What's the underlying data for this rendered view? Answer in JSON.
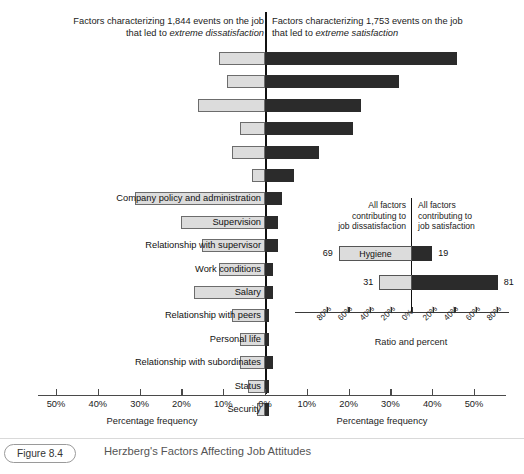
{
  "header": {
    "left_line1": "Factors characterizing 1,844 events on the job",
    "left_line2_prefix": "that led to ",
    "left_line2_em": "extreme dissatisfaction",
    "right_line1": "Factors characterizing 1,753 events on the job",
    "right_line2_prefix": "that led to ",
    "right_line2_em": "extreme satisfaction"
  },
  "axis": {
    "left_title": "Percentage frequency",
    "right_title": "Percentage frequency",
    "ticks_left": [
      "50%",
      "40%",
      "30%",
      "20%",
      "10%",
      "0%"
    ],
    "ticks_right": [
      "0%",
      "10%",
      "20%",
      "30%",
      "40%",
      "50%"
    ]
  },
  "inset": {
    "header_left": "All factors contributing to job dissatisfaction",
    "header_left_lines": [
      "All factors",
      "contributing to",
      "job dissatisfaction"
    ],
    "header_right": "All factors contributing to job satisfaction",
    "header_right_lines": [
      "All factors",
      "contributing to",
      "job satisfaction"
    ],
    "axis_title": "Ratio and percent",
    "ticks": [
      "80%",
      "60%",
      "40%",
      "20%",
      "0%",
      "20%",
      "40%",
      "60%",
      "80%"
    ],
    "rows": [
      {
        "label": "Hygiene",
        "left": 69,
        "right": 19,
        "left_value": "69",
        "right_value": "19"
      },
      {
        "label": "",
        "left": 31,
        "right": 81,
        "left_value": "31",
        "right_value": "81"
      }
    ]
  },
  "caption": {
    "figure_number": "Figure 8.4",
    "title": "Herzberg's Factors Affecting Job Attitudes"
  },
  "colors": {
    "dissatisfaction_bar": "#dcdcdc",
    "satisfaction_bar": "#2b2b2b",
    "axis": "#4a4a4a",
    "center_line": "#111111"
  },
  "chart_data": {
    "type": "bar",
    "title": "Herzberg's Factors Affecting Job Attitudes",
    "subtype": "diverging-horizontal",
    "xlabel": "Percentage frequency",
    "ylabel": "",
    "xlim": [
      -50,
      50
    ],
    "grid": false,
    "legend": [
      "Factors characterizing 1,844 events on the job that led to extreme dissatisfaction",
      "Factors characterizing 1,753 events on the job that led to extreme satisfaction"
    ],
    "categories": [
      "Achievement",
      "Recognition",
      "Work itself",
      "Responsibility",
      "Advancement",
      "Growth",
      "Company policy and administration",
      "Supervision",
      "Relationship with supervisor",
      "Work conditions",
      "Salary",
      "Relationship with peers",
      "Personal life",
      "Relationship with subordinates",
      "Status",
      "Security"
    ],
    "labeled_categories": [
      "Company policy and administration",
      "Supervision",
      "Relationship with supervisor",
      "Work conditions",
      "Salary",
      "Relationship with peers",
      "Personal life",
      "Relationship with subordinates",
      "Status",
      "Security"
    ],
    "series": [
      {
        "name": "Extreme dissatisfaction",
        "values": [
          11,
          9,
          16,
          6,
          8,
          3,
          31,
          20,
          15,
          11,
          17,
          8,
          6,
          6,
          4,
          2
        ]
      },
      {
        "name": "Extreme satisfaction",
        "values": [
          46,
          32,
          23,
          21,
          13,
          7,
          4,
          3,
          3,
          2,
          2,
          1,
          1,
          0,
          1,
          1
        ]
      }
    ],
    "rows": [
      {
        "label": "",
        "left": 11,
        "right": 46,
        "labeled": false
      },
      {
        "label": "",
        "left": 9,
        "right": 32,
        "labeled": false
      },
      {
        "label": "",
        "left": 16,
        "right": 23,
        "labeled": false
      },
      {
        "label": "",
        "left": 6,
        "right": 21,
        "labeled": false
      },
      {
        "label": "",
        "left": 8,
        "right": 13,
        "labeled": false
      },
      {
        "label": "",
        "left": 3,
        "right": 7,
        "labeled": false
      },
      {
        "label": "Company policy and administration",
        "left": 31,
        "right": 4,
        "labeled": true
      },
      {
        "label": "Supervision",
        "left": 20,
        "right": 3,
        "labeled": true
      },
      {
        "label": "Relationship with supervisor",
        "left": 15,
        "right": 3,
        "labeled": true
      },
      {
        "label": "Work conditions",
        "left": 11,
        "right": 2,
        "labeled": true
      },
      {
        "label": "Salary",
        "left": 17,
        "right": 2,
        "labeled": true
      },
      {
        "label": "Relationship with peers",
        "left": 8,
        "right": 1,
        "labeled": true
      },
      {
        "label": "Personal life",
        "left": 6,
        "right": 1,
        "labeled": true
      },
      {
        "label": "Relationship with subordinates",
        "left": 6,
        "right": 2,
        "labeled": true
      },
      {
        "label": "Status",
        "left": 4,
        "right": 1,
        "labeled": true
      },
      {
        "label": "Security",
        "left": 2,
        "right": 1,
        "labeled": true
      }
    ],
    "inset_chart": {
      "type": "bar",
      "subtype": "diverging-horizontal",
      "title": "",
      "xlabel": "Ratio and percent",
      "xlim": [
        -100,
        100
      ],
      "categories": [
        "Hygiene",
        "Motivators"
      ],
      "series": [
        {
          "name": "All factors contributing to job dissatisfaction",
          "values": [
            69,
            31
          ]
        },
        {
          "name": "All factors contributing to job satisfaction",
          "values": [
            19,
            81
          ]
        }
      ]
    }
  }
}
